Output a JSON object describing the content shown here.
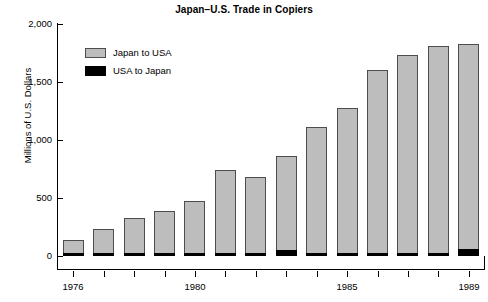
{
  "chart_data": {
    "type": "bar",
    "title": "Japan–U.S. Trade in Copiers",
    "xlabel": "",
    "ylabel": "Millions of U.S. Dollars",
    "ylim": [
      0,
      2000
    ],
    "ytick_labels": [
      "0",
      "500",
      "1,000",
      "1,500",
      "2,000"
    ],
    "ytick_values": [
      0,
      500,
      1000,
      1500,
      2000
    ],
    "grid": false,
    "legend_position": "upper left",
    "categories": [
      "1976",
      "1977",
      "1978",
      "1979",
      "1980",
      "1981",
      "1982",
      "1983",
      "1984",
      "1985",
      "1986",
      "1987",
      "1988",
      "1989"
    ],
    "xtick_labels_shown": [
      "1976",
      "1980",
      "1985",
      "1989"
    ],
    "series": [
      {
        "name": "Japan to USA",
        "color": "#bdbdbd",
        "values": [
          140,
          235,
          325,
          390,
          470,
          745,
          685,
          860,
          1110,
          1280,
          1605,
          1735,
          1810,
          1825
        ]
      },
      {
        "name": "USA to Japan",
        "color": "#000000",
        "values": [
          22,
          25,
          22,
          22,
          22,
          22,
          22,
          55,
          22,
          22,
          22,
          22,
          22,
          58
        ]
      }
    ]
  },
  "legend": {
    "entries": [
      {
        "label": "Japan to USA",
        "swatch": "gray-swatch"
      },
      {
        "label": "USA to Japan",
        "swatch": "black-swatch"
      }
    ]
  }
}
